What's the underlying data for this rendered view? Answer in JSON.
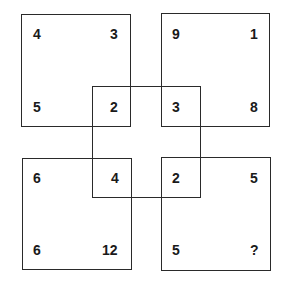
{
  "puzzle": {
    "description": "Four overlapping squares with numbers at corners; find the missing number",
    "squares": {
      "top_left": {
        "tl": "4",
        "tr": "3",
        "bl": "5",
        "br": "2"
      },
      "top_right": {
        "tl": "9",
        "tr": "1",
        "bl": "3",
        "br": "8"
      },
      "bottom_left": {
        "tl": "6",
        "tr": "4",
        "bl": "6",
        "br": "12"
      },
      "bottom_right": {
        "tl": "2",
        "tr": "5",
        "bl": "5",
        "br": "?"
      }
    },
    "center_square_corners": [
      "2",
      "3",
      "4",
      "2"
    ],
    "unknown": "?"
  }
}
